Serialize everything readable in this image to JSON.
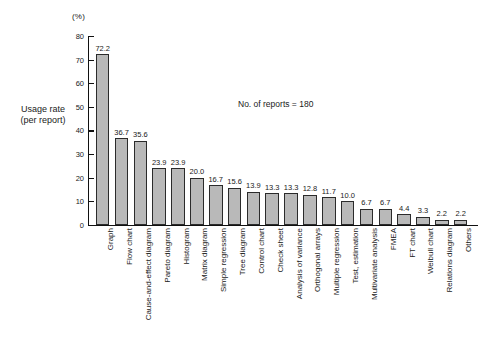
{
  "chart_data": {
    "type": "bar",
    "title": "",
    "subtitle": "",
    "unit_label": "(%)",
    "ylabel": "Usage rate\n(per report)",
    "ylabel_line1": "Usage rate",
    "ylabel_line2": "(per report)",
    "xlabel": "",
    "annotation": "No. of reports = 180",
    "ylim": [
      0,
      80
    ],
    "ytick_step": 10,
    "yticks": [
      0,
      10,
      20,
      30,
      40,
      50,
      60,
      70,
      80
    ],
    "ytick_labels": [
      "0",
      "10",
      "20",
      "30",
      "40",
      "50",
      "60",
      "70",
      "80"
    ],
    "grid": false,
    "legend": "none",
    "bar_fill_color": "#b9b9b9",
    "bar_edge_color": "#2b2b2b",
    "categories": [
      "Graph",
      "Flow chart",
      "Cause-and-effect diagram",
      "Pareto diagram",
      "Histogram",
      "Matrix diagram",
      "Simple regression",
      "Tree diagram",
      "Control chart",
      "Check sheet",
      "Analysis of variance",
      "Orthogonal arrays",
      "Multiple regression",
      "Test, estimation",
      "Multivariate analysis",
      "FMEA",
      "FT chart",
      "Weibull chart",
      "Relations diagram",
      "Others"
    ],
    "values": [
      72.2,
      36.7,
      35.6,
      23.9,
      23.9,
      20.0,
      16.7,
      15.6,
      13.9,
      13.3,
      13.3,
      12.8,
      11.7,
      10.0,
      6.7,
      6.7,
      4.4,
      3.3,
      2.2,
      2.2
    ],
    "value_labels": [
      "72.2",
      "36.7",
      "35.6",
      "23.9",
      "23.9",
      "20.0",
      "16.7",
      "15.6",
      "13.9",
      "13.3",
      "13.3",
      "12.8",
      "11.7",
      "10.0",
      "6.7",
      "6.7",
      "4.4",
      "3.3",
      "2.2",
      "2.2"
    ]
  }
}
